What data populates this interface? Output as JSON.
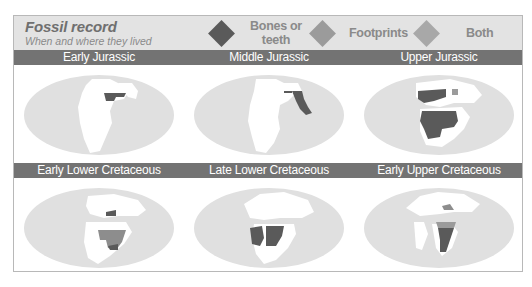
{
  "header": {
    "title": "Fossil record",
    "subtitle": "When and where they lived"
  },
  "legend": [
    {
      "label_line1": "Bones or",
      "label_line2": "teeth",
      "color": "#5a5a5a",
      "icon": "diamond"
    },
    {
      "label_line1": "Footprints",
      "label_line2": "",
      "color": "#9b9b9b",
      "icon": "diamond"
    },
    {
      "label_line1": "Both",
      "label_line2": "",
      "color": "#a8a8a8",
      "icon": "diamond"
    }
  ],
  "colors": {
    "ocean": "#e0e0e0",
    "land": "#ffffff",
    "bones": "#5a5a5a",
    "footprints": "#8d8d8d",
    "title_bar": "#737373"
  },
  "panels": [
    {
      "title": "Early Jurassic",
      "finds": [
        "bones: northern interior band"
      ]
    },
    {
      "title": "Middle Jurassic",
      "finds": [
        "bones: eastern coastal strip"
      ]
    },
    {
      "title": "Upper Jurassic",
      "finds": [
        "bones: northern continent",
        "bones: large southern block",
        "footprints: small northern patch"
      ]
    },
    {
      "title": "Early Lower Cretaceous",
      "finds": [
        "footprints: large southern block",
        "bones: small northern patch",
        "bones: southern tip"
      ]
    },
    {
      "title": "Late Lower Cretaceous",
      "finds": [
        "bones: large southern block"
      ]
    },
    {
      "title": "Early Upper Cretaceous",
      "finds": [
        "bones: africa-shaped block",
        "footprints: northern patch",
        "footprints: africa top strip"
      ]
    }
  ]
}
